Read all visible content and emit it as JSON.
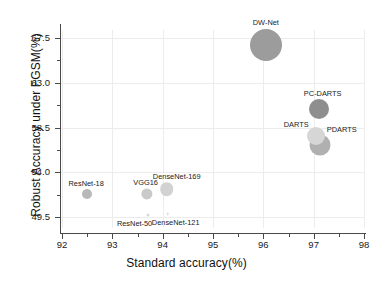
{
  "chart_data": {
    "type": "scatter",
    "title": "",
    "xlabel": "Standard accuracy(%)",
    "ylabel": "Robust Accuracy under FGSM(%)",
    "xlim": [
      92,
      98
    ],
    "ylim": [
      49.5,
      67.5
    ],
    "xticks": [
      "92",
      "93",
      "94",
      "95",
      "96",
      "97",
      "98"
    ],
    "yticks": [
      "49.5",
      "54.0",
      "58.5",
      "63.0",
      "67.5"
    ],
    "grid": true,
    "legend": "none",
    "points": [
      {
        "label": "ResNet-18",
        "x": 92.5,
        "y": 51.8,
        "size": 5.0,
        "color": "#b8b8b8",
        "label_dx": -1,
        "label_dy": -10
      },
      {
        "label": "ResNet-50",
        "x": 93.7,
        "y": 49.7,
        "size": 1.6,
        "color": "#d9d9d9",
        "label_dx": -13,
        "label_dy": 9
      },
      {
        "label": "VGG16",
        "x": 93.68,
        "y": 51.8,
        "size": 5.6,
        "color": "#c9c9c9",
        "label_dx": -1,
        "label_dy": -11
      },
      {
        "label": "DenseNet-121",
        "x": 94.1,
        "y": 49.8,
        "size": 1.4,
        "color": "#e2e2e2",
        "label_dx": 8,
        "label_dy": 9
      },
      {
        "label": "DenseNet-169",
        "x": 94.08,
        "y": 52.3,
        "size": 6.8,
        "color": "#d2d2d2",
        "label_dx": 10,
        "label_dy": -12
      },
      {
        "label": "DARTS",
        "x": 97.05,
        "y": 57.6,
        "size": 9.0,
        "color": "#d6d6d6",
        "label_dx": -20,
        "label_dy": -11
      },
      {
        "label": "PC-DARTS",
        "x": 97.1,
        "y": 60.4,
        "size": 10.0,
        "color": "#8e8e8e",
        "label_dx": 4,
        "label_dy": -15
      },
      {
        "label": "PDARTS",
        "x": 97.12,
        "y": 56.7,
        "size": 10.5,
        "color": "#b0b0b0",
        "label_dx": 22,
        "label_dy": -15
      },
      {
        "label": "DW-Net",
        "x": 96.05,
        "y": 66.8,
        "size": 16.0,
        "color": "#9c9c9c",
        "label_dx": 0,
        "label_dy": -22
      }
    ]
  }
}
